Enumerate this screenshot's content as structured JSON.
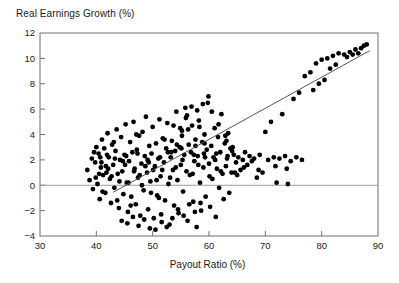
{
  "chart_data": {
    "type": "scatter",
    "title": "Real Earnings Growth (%)",
    "xlabel": "Payout Ratio (%)",
    "ylabel": "Real Earnings Growth (%)",
    "xlim": [
      30,
      90
    ],
    "ylim": [
      -4,
      12
    ],
    "xticks": [
      30,
      40,
      50,
      60,
      70,
      80,
      90
    ],
    "yticks": [
      -4,
      -2,
      0,
      2,
      4,
      6,
      8,
      10,
      12
    ],
    "grid": false,
    "legend": "none",
    "zero_line": {
      "y": 0,
      "color": "#8a8a8a",
      "note": "horizontal reference line at y=0 spanning full axis"
    },
    "marker": {
      "shape": "circle",
      "color": "#000000",
      "size_px": 4
    },
    "trend_line": {
      "type": "linear-fit",
      "color": "#555555",
      "x_start": 43.0,
      "y_start": -0.55,
      "x_end": 88.5,
      "y_end": 10.6,
      "slope": 0.245,
      "intercept": -11.1
    },
    "points": [
      [
        38.4,
        1.2
      ],
      [
        38.8,
        0.4
      ],
      [
        39.2,
        2.1
      ],
      [
        39.4,
        -0.3
      ],
      [
        39.8,
        1.8
      ],
      [
        40.0,
        3.0
      ],
      [
        40.2,
        0.1
      ],
      [
        40.4,
        2.5
      ],
      [
        40.6,
        -1.1
      ],
      [
        40.8,
        1.4
      ],
      [
        41.0,
        3.6
      ],
      [
        41.2,
        0.8
      ],
      [
        41.4,
        2.9
      ],
      [
        41.6,
        -0.6
      ],
      [
        41.8,
        1.0
      ],
      [
        42.0,
        4.1
      ],
      [
        42.2,
        2.2
      ],
      [
        42.4,
        0.5
      ],
      [
        42.6,
        -1.4
      ],
      [
        42.8,
        3.2
      ],
      [
        43.0,
        1.6
      ],
      [
        43.2,
        -0.2
      ],
      [
        43.4,
        2.7
      ],
      [
        43.6,
        4.4
      ],
      [
        43.8,
        0.9
      ],
      [
        44.0,
        -1.8
      ],
      [
        44.2,
        2.0
      ],
      [
        44.4,
        3.8
      ],
      [
        44.6,
        1.1
      ],
      [
        44.8,
        -0.7
      ],
      [
        45.0,
        2.4
      ],
      [
        45.2,
        4.8
      ],
      [
        45.4,
        0.2
      ],
      [
        45.6,
        -2.1
      ],
      [
        45.8,
        1.9
      ],
      [
        46.0,
        3.4
      ],
      [
        46.2,
        -0.9
      ],
      [
        46.4,
        2.6
      ],
      [
        46.6,
        5.0
      ],
      [
        46.8,
        1.3
      ],
      [
        47.0,
        -1.5
      ],
      [
        47.2,
        2.8
      ],
      [
        47.4,
        0.6
      ],
      [
        47.6,
        3.9
      ],
      [
        47.8,
        -2.4
      ],
      [
        48.0,
        1.7
      ],
      [
        48.2,
        4.2
      ],
      [
        48.4,
        -0.4
      ],
      [
        48.6,
        2.3
      ],
      [
        48.8,
        5.4
      ],
      [
        49.0,
        1.0
      ],
      [
        49.2,
        -1.9
      ],
      [
        49.4,
        3.1
      ],
      [
        49.6,
        0.3
      ],
      [
        49.8,
        2.5
      ],
      [
        50.0,
        4.6
      ],
      [
        50.2,
        -2.6
      ],
      [
        50.4,
        1.5
      ],
      [
        50.6,
        3.3
      ],
      [
        50.8,
        -0.8
      ],
      [
        51.0,
        2.1
      ],
      [
        51.2,
        5.2
      ],
      [
        51.4,
        0.7
      ],
      [
        51.6,
        -2.9
      ],
      [
        51.8,
        3.7
      ],
      [
        52.0,
        1.8
      ],
      [
        52.2,
        -1.2
      ],
      [
        52.4,
        2.9
      ],
      [
        52.6,
        4.9
      ],
      [
        52.8,
        0.1
      ],
      [
        53.0,
        -3.1
      ],
      [
        53.2,
        2.2
      ],
      [
        53.4,
        3.5
      ],
      [
        53.6,
        1.2
      ],
      [
        53.8,
        -1.6
      ],
      [
        54.0,
        2.7
      ],
      [
        54.2,
        5.8
      ],
      [
        54.4,
        0.4
      ],
      [
        54.6,
        -2.2
      ],
      [
        54.8,
        3.0
      ],
      [
        55.0,
        1.6
      ],
      [
        55.2,
        4.3
      ],
      [
        55.4,
        -0.5
      ],
      [
        55.6,
        2.4
      ],
      [
        55.8,
        6.1
      ],
      [
        56.0,
        1.1
      ],
      [
        56.2,
        -2.8
      ],
      [
        56.4,
        3.2
      ],
      [
        56.6,
        0.8
      ],
      [
        56.8,
        2.6
      ],
      [
        57.0,
        4.7
      ],
      [
        57.2,
        -1.3
      ],
      [
        57.4,
        1.9
      ],
      [
        57.6,
        3.6
      ],
      [
        57.8,
        -3.3
      ],
      [
        58.0,
        2.3
      ],
      [
        58.2,
        5.1
      ],
      [
        58.4,
        0.2
      ],
      [
        58.6,
        -2.0
      ],
      [
        58.8,
        3.4
      ],
      [
        59.0,
        1.4
      ],
      [
        59.2,
        4.0
      ],
      [
        59.4,
        -0.9
      ],
      [
        59.6,
        2.8
      ],
      [
        59.8,
        6.5
      ],
      [
        60.0,
        1.7
      ],
      [
        60.2,
        -1.7
      ],
      [
        60.4,
        3.1
      ],
      [
        60.6,
        0.5
      ],
      [
        60.8,
        2.2
      ],
      [
        61.0,
        4.5
      ],
      [
        61.2,
        -2.5
      ],
      [
        61.4,
        1.3
      ],
      [
        61.6,
        3.8
      ],
      [
        61.8,
        -0.2
      ],
      [
        62.0,
        2.6
      ],
      [
        62.2,
        5.6
      ],
      [
        62.4,
        0.9
      ],
      [
        62.6,
        -1.1
      ],
      [
        62.8,
        3.3
      ],
      [
        63.0,
        1.5
      ],
      [
        63.2,
        2.1
      ],
      [
        63.4,
        4.1
      ],
      [
        63.6,
        -0.6
      ],
      [
        63.8,
        2.9
      ],
      [
        64.0,
        1.0
      ],
      [
        64.2,
        3.0
      ],
      [
        64.4,
        2.4
      ],
      [
        64.8,
        1.8
      ],
      [
        65.2,
        2.2
      ],
      [
        65.6,
        1.2
      ],
      [
        66.0,
        2.0
      ],
      [
        66.4,
        2.6
      ],
      [
        66.8,
        1.6
      ],
      [
        67.2,
        2.3
      ],
      [
        67.6,
        1.9
      ],
      [
        68.0,
        2.1
      ],
      [
        68.5,
        0.6
      ],
      [
        69.0,
        2.4
      ],
      [
        69.5,
        1.0
      ],
      [
        70.0,
        4.2
      ],
      [
        70.5,
        2.0
      ],
      [
        71.0,
        5.0
      ],
      [
        71.5,
        2.2
      ],
      [
        72.0,
        0.2
      ],
      [
        72.5,
        2.1
      ],
      [
        73.0,
        5.6
      ],
      [
        73.5,
        2.3
      ],
      [
        74.0,
        0.1
      ],
      [
        74.5,
        1.9
      ],
      [
        75.0,
        6.8
      ],
      [
        75.5,
        2.2
      ],
      [
        76.0,
        7.3
      ],
      [
        76.5,
        2.0
      ],
      [
        77.0,
        8.6
      ],
      [
        78.0,
        8.9
      ],
      [
        78.5,
        7.5
      ],
      [
        79.0,
        9.6
      ],
      [
        79.5,
        8.0
      ],
      [
        80.0,
        9.9
      ],
      [
        80.5,
        8.3
      ],
      [
        81.0,
        10.0
      ],
      [
        81.5,
        9.2
      ],
      [
        82.0,
        10.2
      ],
      [
        82.5,
        9.5
      ],
      [
        83.0,
        10.4
      ],
      [
        84.0,
        10.3
      ],
      [
        84.5,
        10.1
      ],
      [
        85.0,
        10.5
      ],
      [
        85.5,
        10.3
      ],
      [
        86.0,
        10.7
      ],
      [
        86.5,
        10.4
      ],
      [
        87.0,
        10.8
      ],
      [
        87.5,
        11.0
      ],
      [
        88.0,
        11.1
      ],
      [
        40.5,
        0.9
      ],
      [
        41.1,
        -0.5
      ],
      [
        42.1,
        1.3
      ],
      [
        43.1,
        3.4
      ],
      [
        44.1,
        0.3
      ],
      [
        45.1,
        1.6
      ],
      [
        46.1,
        -1.6
      ],
      [
        47.1,
        4.0
      ],
      [
        48.1,
        0.0
      ],
      [
        49.1,
        2.0
      ],
      [
        50.1,
        1.2
      ],
      [
        51.1,
        -1.0
      ],
      [
        52.1,
        3.6
      ],
      [
        53.1,
        0.6
      ],
      [
        54.1,
        1.4
      ],
      [
        55.1,
        2.9
      ],
      [
        56.1,
        5.5
      ],
      [
        57.1,
        0.9
      ],
      [
        58.1,
        1.6
      ],
      [
        59.1,
        2.5
      ],
      [
        60.1,
        0.7
      ],
      [
        61.1,
        2.0
      ],
      [
        62.1,
        1.1
      ],
      [
        63.1,
        3.5
      ],
      [
        64.1,
        2.7
      ],
      [
        44.5,
        -2.8
      ],
      [
        45.5,
        -3.0
      ],
      [
        46.5,
        -2.5
      ],
      [
        47.5,
        -3.2
      ],
      [
        48.5,
        -2.7
      ],
      [
        49.5,
        -3.4
      ],
      [
        50.5,
        -3.5
      ],
      [
        51.5,
        -2.3
      ],
      [
        52.5,
        -3.3
      ],
      [
        53.5,
        -2.6
      ],
      [
        54.5,
        -1.9
      ],
      [
        55.5,
        -2.4
      ],
      [
        56.5,
        -1.5
      ],
      [
        57.5,
        -2.1
      ],
      [
        58.5,
        -1.4
      ],
      [
        39.6,
        2.6
      ],
      [
        40.7,
        2.2
      ],
      [
        41.9,
        2.4
      ],
      [
        43.3,
        2.1
      ],
      [
        45.3,
        2.3
      ],
      [
        47.3,
        2.5
      ],
      [
        49.3,
        1.8
      ],
      [
        51.3,
        2.2
      ],
      [
        53.3,
        2.6
      ],
      [
        55.3,
        2.0
      ],
      [
        57.3,
        2.4
      ],
      [
        59.3,
        2.2
      ],
      [
        61.3,
        2.5
      ],
      [
        63.3,
        2.3
      ],
      [
        59.9,
        7.0
      ],
      [
        58.9,
        6.4
      ],
      [
        57.9,
        5.9
      ],
      [
        56.9,
        6.2
      ],
      [
        55.9,
        5.3
      ],
      [
        54.9,
        4.5
      ],
      [
        60.5,
        5.8
      ],
      [
        61.7,
        4.8
      ],
      [
        62.9,
        3.9
      ],
      [
        59.2,
        3.3
      ],
      [
        58.3,
        4.6
      ],
      [
        57.6,
        3.1
      ],
      [
        56.3,
        4.4
      ],
      [
        55.2,
        3.9
      ],
      [
        54.3,
        3.2
      ],
      [
        53.7,
        4.7
      ],
      [
        52.7,
        2.6
      ],
      [
        51.7,
        1.2
      ],
      [
        50.7,
        0.4
      ],
      [
        49.7,
        -0.6
      ],
      [
        48.7,
        1.5
      ],
      [
        47.7,
        0.8
      ],
      [
        46.7,
        1.1
      ],
      [
        45.7,
        0.2
      ],
      [
        44.7,
        1.9
      ],
      [
        43.7,
        -1.2
      ],
      [
        42.7,
        0.7
      ],
      [
        41.7,
        1.5
      ],
      [
        40.9,
        1.8
      ],
      [
        39.9,
        0.6
      ],
      [
        66.2,
        1.4
      ],
      [
        68.8,
        1.2
      ],
      [
        71.8,
        1.5
      ],
      [
        73.8,
        1.3
      ],
      [
        64.6,
        1.0
      ],
      [
        65.0,
        0.8
      ]
    ]
  },
  "axes": {
    "title_text": "Real Earnings Growth (%)",
    "x_axis_label": "Payout Ratio (%)",
    "x_tick_labels": [
      "30",
      "40",
      "50",
      "60",
      "70",
      "80",
      "90"
    ],
    "y_tick_labels": [
      "12",
      "10",
      "8",
      "6",
      "4",
      "2",
      "0",
      "-2",
      "-4"
    ]
  },
  "colors": {
    "marker": "#000000",
    "trend_line": "#555555",
    "zero_line": "#9a9a9a",
    "frame": "#6f6f6f",
    "text": "#1a1a1a",
    "background": "#ffffff"
  }
}
